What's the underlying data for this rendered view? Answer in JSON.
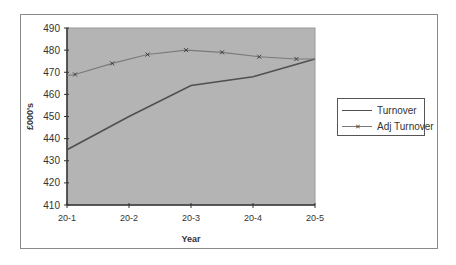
{
  "chart_data": {
    "type": "line",
    "title": "",
    "xlabel": "Year",
    "ylabel": "£000's",
    "categories": [
      "20-1",
      "20-2",
      "20-3",
      "20-4",
      "20-5"
    ],
    "ylim": [
      410,
      490
    ],
    "yticks": [
      410,
      420,
      430,
      440,
      450,
      460,
      470,
      480,
      490
    ],
    "grid": false,
    "legend_position": "right",
    "series": [
      {
        "name": "Turnover",
        "marker": "none",
        "color": "#505050",
        "x": [
          1,
          2,
          3,
          4,
          5
        ],
        "values": [
          435,
          450,
          464,
          468,
          476
        ]
      },
      {
        "name": "Adj Turnover",
        "marker": "x",
        "color": "#7a7a7a",
        "x": [
          1.13,
          1.73,
          2.3,
          2.92,
          3.5,
          4.1,
          4.7
        ],
        "values": [
          469,
          474,
          478,
          480,
          479,
          477,
          476
        ]
      }
    ],
    "colors": {
      "plot_background": "#b4b4b4",
      "axis": "#333333"
    }
  },
  "legend": {
    "items": [
      {
        "label": "Turnover"
      },
      {
        "label": "Adj Turnover"
      }
    ]
  }
}
